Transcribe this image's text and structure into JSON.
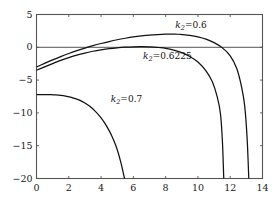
{
  "chart_data": {
    "type": "line",
    "title": "",
    "xlabel": "",
    "ylabel": "",
    "xlim": [
      0,
      14
    ],
    "ylim": [
      -20,
      5
    ],
    "xticks": [
      0,
      2,
      4,
      6,
      8,
      10,
      12,
      14
    ],
    "yticks": [
      5,
      0,
      -5,
      -10,
      -15,
      -20
    ],
    "xtick_labels": [
      "0",
      "2",
      "4",
      "6",
      "8",
      "10",
      "12",
      "14"
    ],
    "ytick_labels": [
      "5",
      "0",
      "−5",
      "−10",
      "−15",
      "−20"
    ],
    "grid": false,
    "legend_position": "inline-annotations",
    "zero_line": 0,
    "series": [
      {
        "name": "k₂=0.6",
        "label": "k₂=0.6",
        "label_math": {
          "symbol": "k",
          "subscript": "2",
          "equals": "=",
          "value": "0.6"
        },
        "color": "#111111",
        "x": [
          0.0,
          0.5,
          1.0,
          1.5,
          2.0,
          2.5,
          3.0,
          3.5,
          4.0,
          4.5,
          5.0,
          5.5,
          6.0,
          6.5,
          7.0,
          7.5,
          8.0,
          8.5,
          8.8,
          9.0,
          9.5,
          10.0,
          10.5,
          11.0,
          11.5,
          12.0,
          12.4,
          12.7,
          12.9,
          13.05,
          13.15
        ],
        "y": [
          -3.0,
          -2.45,
          -1.92,
          -1.42,
          -0.95,
          -0.52,
          -0.12,
          0.25,
          0.58,
          0.88,
          1.15,
          1.38,
          1.58,
          1.74,
          1.87,
          1.95,
          2.0,
          2.0,
          1.99,
          1.95,
          1.82,
          1.6,
          1.25,
          0.72,
          -0.05,
          -1.3,
          -3.2,
          -6.0,
          -9.0,
          -14.0,
          -20.0
        ]
      },
      {
        "name": "k₂=0.6225",
        "label": "k₂=0.6225",
        "label_math": {
          "symbol": "k",
          "subscript": "2",
          "equals": "=",
          "value": "0.6225"
        },
        "color": "#111111",
        "x": [
          0.0,
          0.5,
          1.0,
          1.5,
          2.0,
          2.5,
          3.0,
          3.5,
          4.0,
          4.5,
          5.0,
          5.5,
          6.0,
          6.5,
          7.0,
          7.3,
          7.6,
          8.0,
          8.5,
          9.0,
          9.5,
          10.0,
          10.5,
          10.9,
          11.2,
          11.4,
          11.52,
          11.6
        ],
        "y": [
          -3.5,
          -2.98,
          -2.48,
          -2.0,
          -1.58,
          -1.2,
          -0.88,
          -0.6,
          -0.38,
          -0.2,
          -0.07,
          0.02,
          0.08,
          0.1,
          0.08,
          0.04,
          -0.03,
          -0.15,
          -0.42,
          -0.82,
          -1.4,
          -2.25,
          -3.6,
          -5.3,
          -7.6,
          -10.2,
          -14.5,
          -20.0
        ]
      },
      {
        "name": "k₂=0.7",
        "label": "k₂=0.7",
        "label_math": {
          "symbol": "k",
          "subscript": "2",
          "equals": "=",
          "value": "0.7"
        },
        "color": "#111111",
        "x": [
          0.0,
          0.3,
          0.6,
          0.9,
          1.2,
          1.5,
          1.8,
          2.1,
          2.4,
          2.7,
          3.0,
          3.3,
          3.6,
          3.9,
          4.2,
          4.5,
          4.7,
          4.9,
          5.05,
          5.2,
          5.3,
          5.38,
          5.45
        ],
        "y": [
          -7.2,
          -7.2,
          -7.2,
          -7.22,
          -7.26,
          -7.33,
          -7.44,
          -7.6,
          -7.82,
          -8.1,
          -8.5,
          -9.0,
          -9.65,
          -10.45,
          -11.45,
          -12.7,
          -13.7,
          -14.9,
          -16.0,
          -17.3,
          -18.3,
          -19.2,
          -20.0
        ]
      }
    ],
    "annotations": [
      {
        "text": "k₂=0.6",
        "x": 8.6,
        "y": 3.2,
        "series": "k₂=0.6"
      },
      {
        "text": "k₂=0.6225",
        "x": 6.6,
        "y": -1.5,
        "series": "k₂=0.6225"
      },
      {
        "text": "k₂=0.7",
        "x": 4.6,
        "y": -8.0,
        "series": "k₂=0.7"
      }
    ]
  },
  "axes": {
    "frame_color": "#555555",
    "zero_line_color": "#555555",
    "curve_color": "#111111"
  }
}
